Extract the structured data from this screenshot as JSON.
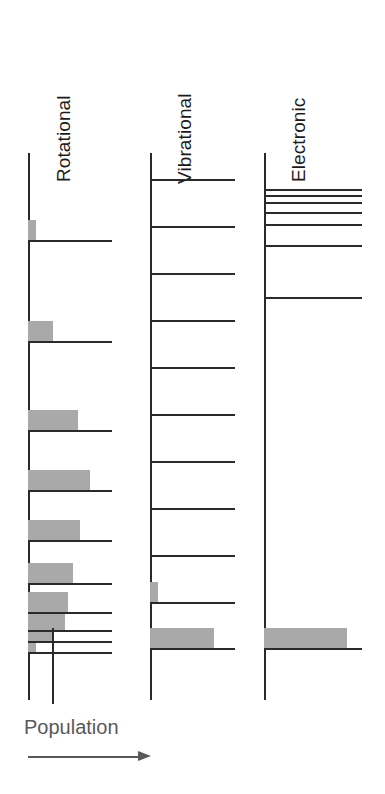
{
  "figure": {
    "background_color": "#ffffff",
    "line_color": "#2a2a2a",
    "bar_color": "#a9a9a9",
    "annotation_color": "#595959",
    "width": 385,
    "height": 794
  },
  "axis_annotation": {
    "label": "Population",
    "arrow_direction": "right",
    "arrow_icon": "arrow-right-icon"
  },
  "columns": [
    {
      "id": "rotational",
      "caption": "Rotational",
      "axis_x": 28,
      "axis_top": 153,
      "axis_bottom": 700,
      "level_length": 84,
      "description": "Closely spaced rotational levels; population peaks at an intermediate level producing a Boltzmann-like envelope.",
      "levels": [
        {
          "index": 0,
          "y": 652,
          "line_length": 84,
          "population": 10
        },
        {
          "index": 1,
          "y": 641,
          "line_length": 84,
          "population": 30
        },
        {
          "index": 2,
          "y": 630,
          "line_length": 84,
          "population": 44
        },
        {
          "index": 3,
          "y": 612,
          "line_length": 84,
          "population": 48
        },
        {
          "index": 4,
          "y": 583,
          "line_length": 84,
          "population": 54
        },
        {
          "index": 5,
          "y": 540,
          "line_length": 84,
          "population": 62
        },
        {
          "index": 6,
          "y": 490,
          "line_length": 84,
          "population": 74
        },
        {
          "index": 7,
          "y": 430,
          "line_length": 84,
          "population": 60
        },
        {
          "index": 8,
          "y": 341,
          "line_length": 84,
          "population": 30
        },
        {
          "index": 9,
          "y": 240,
          "line_length": 84,
          "population": 10
        },
        {
          "index": 10,
          "y": 153,
          "line_length": 0,
          "population": 0
        }
      ]
    },
    {
      "id": "vibrational",
      "caption": "Vibrational",
      "axis_x": 150,
      "axis_top": 153,
      "axis_bottom": 700,
      "level_length": 85,
      "description": "Evenly spaced vibrational levels; essentially all population resides in the lowest level.",
      "levels": [
        {
          "index": 0,
          "y": 648,
          "line_length": 85,
          "population": 75
        },
        {
          "index": 1,
          "y": 602,
          "line_length": 85,
          "population": 5
        },
        {
          "index": 2,
          "y": 555,
          "line_length": 85,
          "population": 0
        },
        {
          "index": 3,
          "y": 508,
          "line_length": 85,
          "population": 0
        },
        {
          "index": 4,
          "y": 461,
          "line_length": 85,
          "population": 0
        },
        {
          "index": 5,
          "y": 414,
          "line_length": 85,
          "population": 0
        },
        {
          "index": 6,
          "y": 367,
          "line_length": 85,
          "population": 0
        },
        {
          "index": 7,
          "y": 320,
          "line_length": 85,
          "population": 0
        },
        {
          "index": 8,
          "y": 273,
          "line_length": 85,
          "population": 0
        },
        {
          "index": 9,
          "y": 226,
          "line_length": 85,
          "population": 0
        },
        {
          "index": 10,
          "y": 179,
          "line_length": 85,
          "population": 0
        }
      ]
    },
    {
      "id": "electronic",
      "caption": "Electronic",
      "axis_x": 264,
      "axis_top": 153,
      "axis_bottom": 700,
      "level_length": 98,
      "description": "Widely separated electronic states converging towards the ionisation limit; only the ground state is populated.",
      "levels": [
        {
          "index": 0,
          "y": 648,
          "line_length": 98,
          "population": 85
        },
        {
          "index": 1,
          "y": 297,
          "line_length": 98,
          "population": 0
        },
        {
          "index": 2,
          "y": 245,
          "line_length": 98,
          "population": 0
        },
        {
          "index": 3,
          "y": 224,
          "line_length": 98,
          "population": 0
        },
        {
          "index": 4,
          "y": 212,
          "line_length": 98,
          "population": 0
        },
        {
          "index": 5,
          "y": 202,
          "line_length": 98,
          "population": 0
        },
        {
          "index": 6,
          "y": 195,
          "line_length": 98,
          "population": 0
        },
        {
          "index": 7,
          "y": 189,
          "line_length": 98,
          "population": 0
        }
      ]
    }
  ],
  "chart_data": {
    "type": "bar",
    "xlabel": "Population",
    "ylabel": "Energy",
    "orientation": "horizontal",
    "grid": false,
    "legend": false,
    "panels": [
      {
        "name": "Rotational",
        "categories": [
          "J=0",
          "J=1",
          "J=2",
          "J=3",
          "J=4",
          "J=5",
          "J=6",
          "J=7",
          "J=8",
          "J=9",
          "J=10"
        ],
        "values": [
          10,
          30,
          44,
          48,
          54,
          62,
          74,
          60,
          30,
          10,
          0
        ]
      },
      {
        "name": "Vibrational",
        "categories": [
          "v=0",
          "v=1",
          "v=2",
          "v=3",
          "v=4",
          "v=5",
          "v=6",
          "v=7",
          "v=8",
          "v=9",
          "v=10"
        ],
        "values": [
          75,
          5,
          0,
          0,
          0,
          0,
          0,
          0,
          0,
          0,
          0
        ]
      },
      {
        "name": "Electronic",
        "categories": [
          "n=0",
          "n=1",
          "n=2",
          "n=3",
          "n=4",
          "n=5",
          "n=6",
          "n=7"
        ],
        "values": [
          85,
          0,
          0,
          0,
          0,
          0,
          0,
          0
        ]
      }
    ]
  }
}
